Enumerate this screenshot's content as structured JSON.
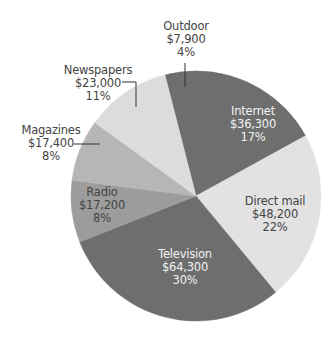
{
  "chart_data": {
    "type": "pie",
    "title": "",
    "start_angle_deg": -104.4,
    "direction": "clockwise",
    "center": [
      196,
      196
    ],
    "radius": 125,
    "slices": [
      {
        "label": "Outdoor",
        "value": 7900,
        "value_text": "$7,900",
        "percent": 4,
        "percent_text": "4%",
        "color": "#6e6e6e"
      },
      {
        "label": "Internet",
        "value": 36300,
        "value_text": "$36,300",
        "percent": 17,
        "percent_text": "17%",
        "color": "#6e6e6e"
      },
      {
        "label": "Direct mail",
        "value": 48200,
        "value_text": "$48,200",
        "percent": 22,
        "percent_text": "22%",
        "color": "#e2e2e2"
      },
      {
        "label": "Television",
        "value": 64300,
        "value_text": "$64,300",
        "percent": 30,
        "percent_text": "30%",
        "color": "#6e6e6e"
      },
      {
        "label": "Radio",
        "value": 17200,
        "value_text": "$17,200",
        "percent": 8,
        "percent_text": "8%",
        "color": "#9c9c9c"
      },
      {
        "label": "Magazines",
        "value": 17400,
        "value_text": "$17,400",
        "percent": 8,
        "percent_text": "8%",
        "color": "#b6b6b6"
      },
      {
        "label": "Newspapers",
        "value": 23000,
        "value_text": "$23,000",
        "percent": 11,
        "percent_text": "11%",
        "color": "#dcdcdc"
      }
    ]
  }
}
